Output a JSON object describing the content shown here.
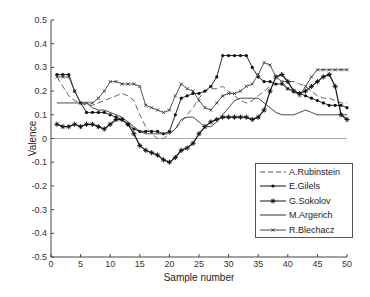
{
  "chart_data": {
    "type": "line",
    "title": "",
    "xlabel": "Sample number",
    "ylabel": "Valence",
    "xlim": [
      0,
      50
    ],
    "ylim": [
      -0.5,
      0.5
    ],
    "xticks": [
      0,
      5,
      10,
      15,
      20,
      25,
      30,
      35,
      40,
      45,
      50
    ],
    "yticks": [
      -0.5,
      -0.4,
      -0.3,
      -0.2,
      -0.1,
      0,
      0.1,
      0.2,
      0.3,
      0.4,
      0.5
    ],
    "grid": false,
    "legend_position": "lower right",
    "x": [
      1,
      2,
      3,
      4,
      5,
      6,
      7,
      8,
      9,
      10,
      11,
      12,
      13,
      14,
      15,
      16,
      17,
      18,
      19,
      20,
      21,
      22,
      23,
      24,
      25,
      26,
      27,
      28,
      29,
      30,
      31,
      32,
      33,
      34,
      35,
      36,
      37,
      38,
      39,
      40,
      41,
      42,
      43,
      44,
      45,
      46,
      47,
      48,
      49,
      50
    ],
    "series": [
      {
        "name": "A.Rubinstein",
        "style": "dashed",
        "values": [
          0.26,
          0.22,
          0.18,
          0.16,
          0.15,
          0.14,
          0.14,
          0.15,
          0.16,
          0.17,
          0.18,
          0.19,
          0.18,
          0.16,
          0.1,
          0.05,
          0.02,
          0.0,
          0.0,
          0.02,
          0.04,
          0.07,
          0.1,
          0.13,
          0.17,
          0.2,
          0.21,
          0.21,
          0.22,
          0.2,
          0.18,
          0.16,
          0.15,
          0.16,
          0.18,
          0.2,
          0.22,
          0.23,
          0.24,
          0.24,
          0.24,
          0.23,
          0.22,
          0.2,
          0.18,
          0.17,
          0.17,
          0.16,
          0.15,
          0.15
        ]
      },
      {
        "name": "E.Gilels",
        "style": "dot-marker",
        "values": [
          0.27,
          0.27,
          0.27,
          0.2,
          0.15,
          0.11,
          0.11,
          0.11,
          0.11,
          0.1,
          0.09,
          0.08,
          0.06,
          0.04,
          0.03,
          0.03,
          0.03,
          0.03,
          0.02,
          0.03,
          0.1,
          0.17,
          0.18,
          0.19,
          0.19,
          0.2,
          0.22,
          0.26,
          0.35,
          0.35,
          0.35,
          0.35,
          0.35,
          0.3,
          0.26,
          0.24,
          0.24,
          0.23,
          0.23,
          0.21,
          0.2,
          0.19,
          0.18,
          0.17,
          0.16,
          0.15,
          0.14,
          0.14,
          0.14,
          0.13
        ]
      },
      {
        "name": "G.Sokolov",
        "style": "star-marker",
        "values": [
          0.06,
          0.05,
          0.05,
          0.06,
          0.05,
          0.06,
          0.06,
          0.05,
          0.04,
          0.06,
          0.08,
          0.08,
          0.06,
          0.02,
          -0.03,
          -0.05,
          -0.06,
          -0.07,
          -0.09,
          -0.1,
          -0.08,
          -0.05,
          -0.04,
          -0.02,
          0.02,
          0.05,
          0.07,
          0.08,
          0.09,
          0.09,
          0.09,
          0.09,
          0.09,
          0.08,
          0.09,
          0.12,
          0.2,
          0.26,
          0.27,
          0.24,
          0.2,
          0.19,
          0.2,
          0.22,
          0.24,
          0.26,
          0.27,
          0.22,
          0.1,
          0.08
        ]
      },
      {
        "name": "M.Argerich",
        "style": "solid",
        "values": [
          0.15,
          0.15,
          0.15,
          0.15,
          0.15,
          0.15,
          0.13,
          0.12,
          0.12,
          0.11,
          0.1,
          0.09,
          0.07,
          0.05,
          0.03,
          0.02,
          0.02,
          0.02,
          0.02,
          0.02,
          0.04,
          0.08,
          0.09,
          0.09,
          0.07,
          0.05,
          0.05,
          0.07,
          0.1,
          0.13,
          0.16,
          0.17,
          0.17,
          0.17,
          0.17,
          0.15,
          0.13,
          0.11,
          0.1,
          0.1,
          0.1,
          0.11,
          0.12,
          0.11,
          0.1,
          0.1,
          0.1,
          0.1,
          0.1,
          0.1
        ]
      },
      {
        "name": "R.Blechacz",
        "style": "x-marker",
        "values": [
          0.26,
          0.26,
          0.26,
          0.2,
          0.15,
          0.15,
          0.15,
          0.17,
          0.2,
          0.24,
          0.24,
          0.23,
          0.23,
          0.23,
          0.22,
          0.14,
          0.13,
          0.12,
          0.11,
          0.12,
          0.18,
          0.23,
          0.21,
          0.2,
          0.16,
          0.13,
          0.12,
          0.15,
          0.18,
          0.19,
          0.19,
          0.2,
          0.22,
          0.23,
          0.27,
          0.32,
          0.31,
          0.26,
          0.24,
          0.21,
          0.2,
          0.18,
          0.22,
          0.26,
          0.29,
          0.29,
          0.29,
          0.29,
          0.29,
          0.29
        ]
      }
    ]
  }
}
